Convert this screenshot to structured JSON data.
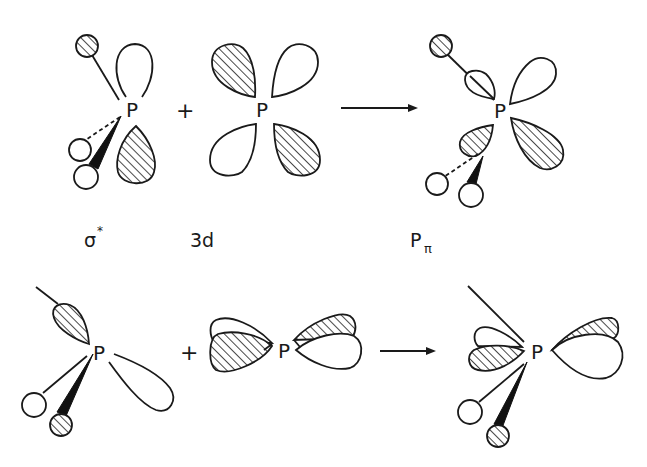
{
  "figure": {
    "type": "orbital-interaction-diagram",
    "rows": [
      {
        "id": "top-row",
        "left_fragment": {
          "atom_label": "P",
          "caption": "σ",
          "caption_superscript": "*",
          "description": "sigma-star orbital of pyramidal PR3 with one p-type lobe up (open) and down (hatched); one substituent hatched sphere, two open spheres (one dashed bond, one wedge bond)"
        },
        "operator": "+",
        "middle_fragment": {
          "atom_label": "P",
          "caption": "3d",
          "description": "four-lobed d orbital, alternating hatched (upper-left, lower-right) and open (upper-right, lower-left) lobes"
        },
        "arrow": "→",
        "right_fragment": {
          "atom_label": "P",
          "caption": "P",
          "caption_subscript": "π",
          "description": "resulting hybrid P-pi orbital"
        }
      },
      {
        "id": "bottom-row",
        "left_fragment": {
          "atom_label": "P",
          "description": "hatched lobe upper-left along bond, open lobe lower-right; open sphere and hatched sphere (wedge) substituents"
        },
        "operator": "+",
        "middle_fragment": {
          "atom_label": "P",
          "description": "horizontal d-type orbital with mixed hatched/open double-lobes"
        },
        "arrow": "→",
        "right_fragment": {
          "atom_label": "P",
          "description": "resulting mixed orbital"
        }
      }
    ]
  },
  "colors": {
    "ink": "#1a1a1a",
    "background": "#ffffff"
  }
}
